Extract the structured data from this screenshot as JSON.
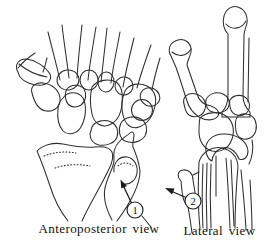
{
  "diagram": {
    "ap_view": {
      "label": "Anteroposterior view",
      "callout_number": "1"
    },
    "lateral_view": {
      "label": "Lateral view",
      "callout_number": "2"
    },
    "colors": {
      "background": "#ffffff",
      "line": "#2f2f2f",
      "callout": "#1c1c1c",
      "text": "#101010"
    }
  }
}
